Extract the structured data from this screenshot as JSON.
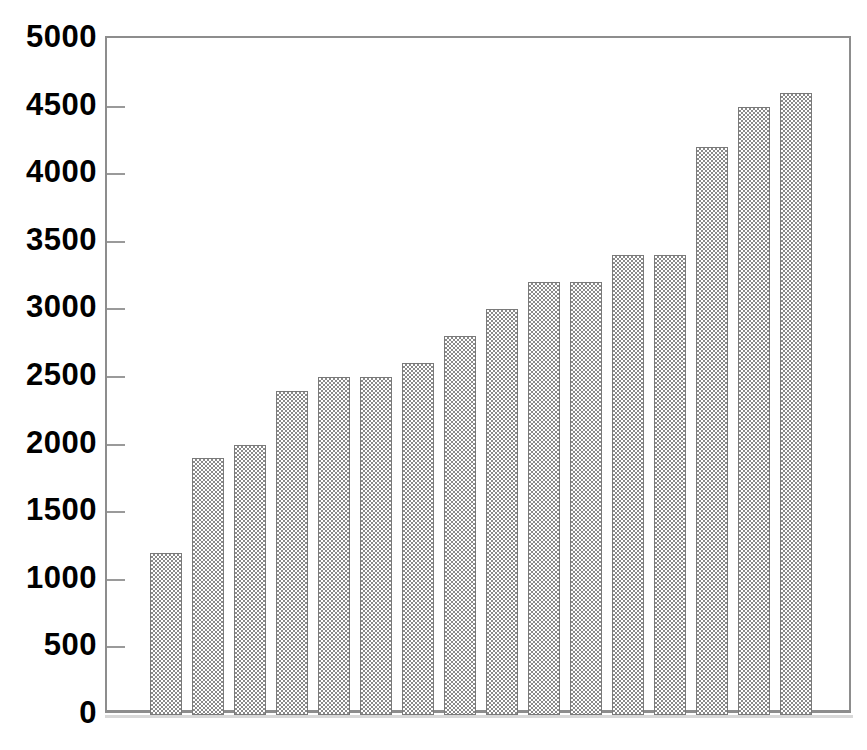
{
  "chart_data": {
    "type": "bar",
    "title": "",
    "subtitle": "",
    "xlabel": "",
    "ylabel": "",
    "categories": [
      "1",
      "2",
      "3",
      "4",
      "5",
      "6",
      "7",
      "8",
      "9",
      "10",
      "11",
      "12",
      "13",
      "14",
      "15",
      "16"
    ],
    "values": [
      1200,
      1900,
      2000,
      2400,
      2500,
      2500,
      2600,
      2800,
      3000,
      3200,
      3200,
      3400,
      3400,
      4200,
      4500,
      4600
    ],
    "series": [
      {
        "name": "",
        "values": [
          1200,
          1900,
          2000,
          2400,
          2500,
          2500,
          2600,
          2800,
          3000,
          3200,
          3200,
          3400,
          3400,
          4200,
          4500,
          4600
        ]
      }
    ],
    "ylim": [
      0,
      5000
    ],
    "ytick_step": 500,
    "ytick_labels": [
      "0",
      "500",
      "1000",
      "1500",
      "2000",
      "2500",
      "3000",
      "3500",
      "4000",
      "4500",
      "5000"
    ],
    "ytick_values": [
      0,
      500,
      1000,
      1500,
      2000,
      2500,
      3000,
      3500,
      4000,
      4500,
      5000
    ],
    "xtick_labels": [],
    "grid": false,
    "legend": false,
    "legend_position": "none",
    "bar_fill": "#8a8a8a",
    "bar_fill_style": "checkerboard-pattern",
    "bar_border_color": "#7a7a7a",
    "axis_color": "#8d8d8d",
    "background_color": "#ffffff",
    "label_color": "#000000"
  }
}
